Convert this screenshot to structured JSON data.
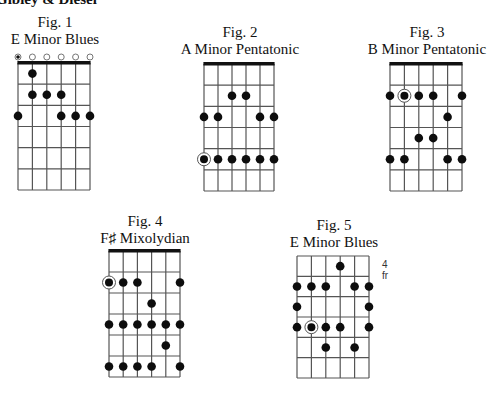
{
  "header": {
    "text": "Gibley & Diesel"
  },
  "figures": [
    {
      "id": "fig1",
      "number": "Fig. 1",
      "title": "E Minor Blues",
      "nut": true,
      "fret_label": "",
      "frets": 6,
      "open_strings": [
        {
          "string": 1,
          "type": "root"
        },
        {
          "string": 2,
          "type": "open"
        },
        {
          "string": 3,
          "type": "open"
        },
        {
          "string": 4,
          "type": "open"
        },
        {
          "string": 5,
          "type": "open"
        },
        {
          "string": 6,
          "type": "open"
        }
      ],
      "dots": [
        {
          "string": 2,
          "fret": 1
        },
        {
          "string": 2,
          "fret": 2
        },
        {
          "string": 3,
          "fret": 2
        },
        {
          "string": 4,
          "fret": 2
        },
        {
          "string": 1,
          "fret": 3
        },
        {
          "string": 4,
          "fret": 3
        },
        {
          "string": 5,
          "fret": 3
        },
        {
          "string": 6,
          "fret": 3
        }
      ],
      "layout": {
        "x0": 18,
        "x1": 90,
        "y0": 63,
        "y1": 190,
        "cap_cx": 55,
        "cap_y": 14
      }
    },
    {
      "id": "fig2",
      "number": "Fig. 2",
      "title": "A Minor Pentatonic",
      "nut": true,
      "fret_label": "",
      "frets": 6,
      "open_strings": [],
      "dots": [
        {
          "string": 3,
          "fret": 2
        },
        {
          "string": 4,
          "fret": 2
        },
        {
          "string": 1,
          "fret": 3
        },
        {
          "string": 2,
          "fret": 3
        },
        {
          "string": 5,
          "fret": 3
        },
        {
          "string": 6,
          "fret": 3
        },
        {
          "string": 1,
          "fret": 5,
          "root": true
        },
        {
          "string": 2,
          "fret": 5
        },
        {
          "string": 3,
          "fret": 5
        },
        {
          "string": 4,
          "fret": 5
        },
        {
          "string": 5,
          "fret": 5
        },
        {
          "string": 6,
          "fret": 5
        }
      ],
      "layout": {
        "x0": 204,
        "x1": 274,
        "y0": 64,
        "y1": 191,
        "cap_cx": 240,
        "cap_y": 24
      }
    },
    {
      "id": "fig3",
      "number": "Fig. 3",
      "title": "B Minor Pentatonic",
      "nut": true,
      "fret_label": "",
      "frets": 6,
      "open_strings": [],
      "dots": [
        {
          "string": 1,
          "fret": 2
        },
        {
          "string": 2,
          "fret": 2,
          "root": true
        },
        {
          "string": 3,
          "fret": 2
        },
        {
          "string": 4,
          "fret": 2
        },
        {
          "string": 6,
          "fret": 2
        },
        {
          "string": 5,
          "fret": 3
        },
        {
          "string": 3,
          "fret": 4
        },
        {
          "string": 4,
          "fret": 4
        },
        {
          "string": 1,
          "fret": 5
        },
        {
          "string": 2,
          "fret": 5
        },
        {
          "string": 5,
          "fret": 5
        },
        {
          "string": 6,
          "fret": 5
        }
      ],
      "layout": {
        "x0": 390,
        "x1": 462,
        "y0": 64,
        "y1": 191,
        "cap_cx": 427,
        "cap_y": 24
      }
    },
    {
      "id": "fig4",
      "number": "Fig. 4",
      "title": "F♯ Mixolydian",
      "nut": true,
      "fret_label": "",
      "frets": 6,
      "open_strings": [],
      "dots": [
        {
          "string": 1,
          "fret": 2,
          "root": true
        },
        {
          "string": 2,
          "fret": 2
        },
        {
          "string": 3,
          "fret": 2
        },
        {
          "string": 6,
          "fret": 2
        },
        {
          "string": 4,
          "fret": 3
        },
        {
          "string": 1,
          "fret": 4
        },
        {
          "string": 2,
          "fret": 4
        },
        {
          "string": 3,
          "fret": 4
        },
        {
          "string": 4,
          "fret": 4
        },
        {
          "string": 5,
          "fret": 4
        },
        {
          "string": 6,
          "fret": 4
        },
        {
          "string": 5,
          "fret": 5
        },
        {
          "string": 1,
          "fret": 6
        },
        {
          "string": 2,
          "fret": 6
        },
        {
          "string": 3,
          "fret": 6
        },
        {
          "string": 4,
          "fret": 6
        },
        {
          "string": 6,
          "fret": 6
        }
      ],
      "layout": {
        "x0": 109,
        "x1": 180,
        "y0": 251,
        "y1": 377,
        "cap_cx": 145,
        "cap_y": 213
      }
    },
    {
      "id": "fig5",
      "number": "Fig. 5",
      "title": "E Minor Blues",
      "nut": false,
      "fret_label": "4 fr",
      "frets": 6,
      "open_strings": [],
      "dots": [
        {
          "string": 4,
          "fret": 1
        },
        {
          "string": 1,
          "fret": 2
        },
        {
          "string": 2,
          "fret": 2
        },
        {
          "string": 3,
          "fret": 2
        },
        {
          "string": 5,
          "fret": 2
        },
        {
          "string": 6,
          "fret": 2
        },
        {
          "string": 1,
          "fret": 3
        },
        {
          "string": 6,
          "fret": 3
        },
        {
          "string": 1,
          "fret": 4
        },
        {
          "string": 2,
          "fret": 4,
          "root": true
        },
        {
          "string": 3,
          "fret": 4
        },
        {
          "string": 4,
          "fret": 4
        },
        {
          "string": 6,
          "fret": 4
        },
        {
          "string": 3,
          "fret": 5
        },
        {
          "string": 5,
          "fret": 5
        }
      ],
      "layout": {
        "x0": 297,
        "x1": 369,
        "y0": 256,
        "y1": 378,
        "cap_cx": 334,
        "cap_y": 217
      }
    }
  ]
}
